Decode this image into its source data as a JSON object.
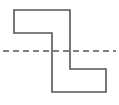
{
  "figure": {
    "canvas": {
      "width": 119,
      "height": 105,
      "background": "#ffffff"
    },
    "shape": {
      "name": "z-polygon",
      "stroke_color": "#555555",
      "stroke_width": 1.6,
      "fill": "none",
      "closed": true,
      "points": "14,10 70,10 70,69 106,69 106,92 52,92 52,33 14,33",
      "vertices": [
        {
          "x": 14,
          "y": 10
        },
        {
          "x": 70,
          "y": 10
        },
        {
          "x": 70,
          "y": 69
        },
        {
          "x": 106,
          "y": 69
        },
        {
          "x": 106,
          "y": 92
        },
        {
          "x": 52,
          "y": 92
        },
        {
          "x": 52,
          "y": 33
        },
        {
          "x": 14,
          "y": 33
        }
      ]
    },
    "axis": {
      "name": "horizontal-dashed-axis",
      "orientation": "horizontal",
      "y": 51,
      "x_start": 3,
      "x_end": 116,
      "stroke_color": "#555555",
      "stroke_width": 1.6,
      "dash_pattern": "6 4"
    }
  }
}
